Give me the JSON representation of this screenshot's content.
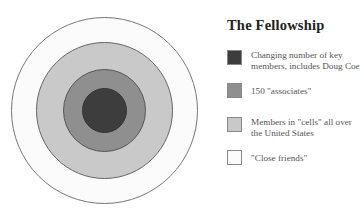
{
  "title": "The Fellowship",
  "rings": [
    {
      "name": "outer",
      "radius": 93,
      "color": "#fbfbfb"
    },
    {
      "name": "members-cells",
      "radius": 68,
      "color": "#c9c9c9"
    },
    {
      "name": "associates",
      "radius": 41,
      "color": "#8f8f8f"
    },
    {
      "name": "core",
      "radius": 22,
      "color": "#3d3d3d"
    }
  ],
  "legend": [
    {
      "label": "Changing number of key members, includes Doug Coe",
      "color": "#3d3d3d"
    },
    {
      "label": "150 \"associates\"",
      "color": "#8f8f8f"
    },
    {
      "label": "Members in \"cells\" all over the United States",
      "color": "#c9c9c9"
    },
    {
      "label": "\"Close friends\"",
      "color": "#fbfbfb"
    }
  ]
}
